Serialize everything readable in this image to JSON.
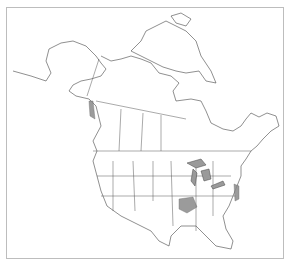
{
  "map": {
    "title": "North America range map",
    "region": "North America (Canada, United States, Mexico)",
    "colors": {
      "background": "#ffffff",
      "outline": "#444444",
      "range_fill": "#8a8a8a",
      "frame": "#bdbdbd"
    },
    "shaded_regions": [
      "Southern Illinois / southeast Missouri",
      "Great Lakes shorelines (Lake Superior, Michigan, Huron, Erie, Ontario)",
      "Mid-Atlantic coast (New Jersey / Delaware / Maryland / Virginia)",
      "Pacific Northwest coast (British Columbia islands)"
    ]
  }
}
